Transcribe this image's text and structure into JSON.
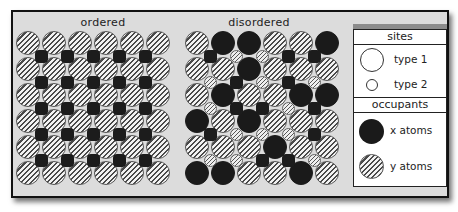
{
  "panels": {
    "ordered": {
      "title": "ordered",
      "type1_sites": [
        [
          "y",
          "y",
          "y",
          "y",
          "y",
          "y"
        ],
        [
          "y",
          "y",
          "y",
          "y",
          "y",
          "y"
        ],
        [
          "y",
          "y",
          "y",
          "y",
          "y",
          "y"
        ],
        [
          "y",
          "y",
          "y",
          "y",
          "y",
          "y"
        ],
        [
          "y",
          "y",
          "y",
          "y",
          "y",
          "y"
        ],
        [
          "y",
          "y",
          "y",
          "y",
          "y",
          "y"
        ]
      ],
      "type2_sites": [
        [
          "x",
          "x",
          "x",
          "x",
          "x"
        ],
        [
          "x",
          "x",
          "x",
          "x",
          "x"
        ],
        [
          "x",
          "x",
          "x",
          "x",
          "x"
        ],
        [
          "x",
          "x",
          "x",
          "x",
          "x"
        ],
        [
          "x",
          "x",
          "x",
          "x",
          "x"
        ]
      ]
    },
    "disordered": {
      "title": "disordered",
      "type1_sites": [
        [
          "y",
          "x",
          "x",
          "y",
          "y",
          "x"
        ],
        [
          "y",
          "y",
          "x",
          "y",
          "y",
          "y"
        ],
        [
          "y",
          "x",
          "y",
          "y",
          "x",
          "x"
        ],
        [
          "x",
          "y",
          "x",
          "y",
          "y",
          "y"
        ],
        [
          "y",
          "y",
          "y",
          "x",
          "y",
          "y"
        ],
        [
          "x",
          "x",
          "y",
          "y",
          "x",
          "y"
        ]
      ],
      "type2_sites": [
        [
          "x",
          "y",
          "y",
          "x",
          "x"
        ],
        [
          "y",
          "x",
          "y",
          "x",
          "y"
        ],
        [
          "y",
          "x",
          "x",
          "y",
          "x"
        ],
        [
          "x",
          "y",
          "y",
          "y",
          "x"
        ],
        [
          "y",
          "y",
          "x",
          "x",
          "y"
        ]
      ]
    }
  },
  "legend": {
    "sites_header": "sites",
    "type1_label": "type 1",
    "type2_label": "type 2",
    "occupants_header": "occupants",
    "x_label": "x atoms",
    "y_label": "y atoms"
  },
  "colors": {
    "x_atom": "#1a1a1a",
    "frame_bg": "#dcdcdc",
    "legend_bar": "#8c8c8c"
  }
}
